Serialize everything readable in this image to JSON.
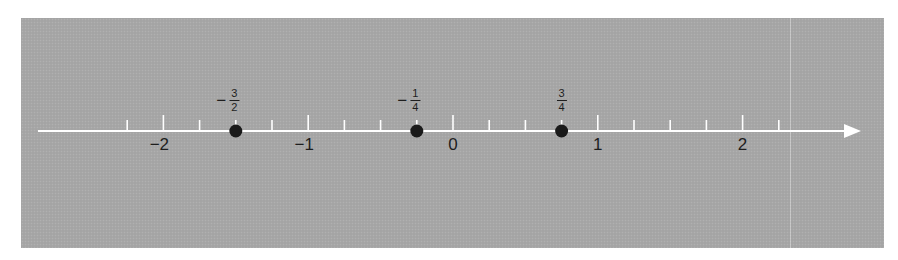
{
  "figure": {
    "type": "number-line",
    "background_color": "#a7a7a7",
    "line_color": "#ffffff",
    "point_color": "#1a1a1a",
    "label_color": "#1e1e1e",
    "axis": {
      "min_tick": -2.25,
      "max_tick": 2.25,
      "minor_step": 0.25,
      "major_step": 1,
      "arrow_direction": "right"
    },
    "integer_labels": [
      {
        "value": -2,
        "text": "−2"
      },
      {
        "value": -1,
        "text": "−1"
      },
      {
        "value": 0,
        "text": "0"
      },
      {
        "value": 1,
        "text": "1"
      },
      {
        "value": 2,
        "text": "2"
      }
    ],
    "points": [
      {
        "value": -1.5,
        "sign": "−",
        "numerator": "3",
        "denominator": "2"
      },
      {
        "value": -0.25,
        "sign": "−",
        "numerator": "1",
        "denominator": "4"
      },
      {
        "value": 0.75,
        "sign": "",
        "numerator": "3",
        "denominator": "4"
      }
    ]
  }
}
